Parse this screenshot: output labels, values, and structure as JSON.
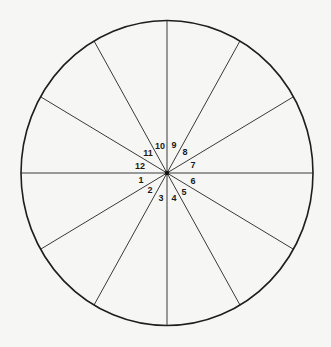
{
  "diagram": {
    "type": "sectored-circle",
    "sector_count": 12,
    "colors": {
      "background": "#f6f6f5",
      "outline": "#1e1e1e",
      "spoke": "#3a3a3a",
      "label": "#1a1a1a"
    },
    "sectors": [
      {
        "label": "1",
        "x": 141,
        "y": 183
      },
      {
        "label": "2",
        "x": 150,
        "y": 193
      },
      {
        "label": "3",
        "x": 161,
        "y": 201
      },
      {
        "label": "4",
        "x": 174,
        "y": 201
      },
      {
        "label": "5",
        "x": 184,
        "y": 195
      },
      {
        "label": "6",
        "x": 193,
        "y": 184
      },
      {
        "label": "7",
        "x": 193,
        "y": 168
      },
      {
        "label": "8",
        "x": 185,
        "y": 155
      },
      {
        "label": "9",
        "x": 174,
        "y": 148
      },
      {
        "label": "10",
        "x": 160,
        "y": 149
      },
      {
        "label": "11",
        "x": 148,
        "y": 156
      },
      {
        "label": "12",
        "x": 140,
        "y": 169
      }
    ]
  }
}
